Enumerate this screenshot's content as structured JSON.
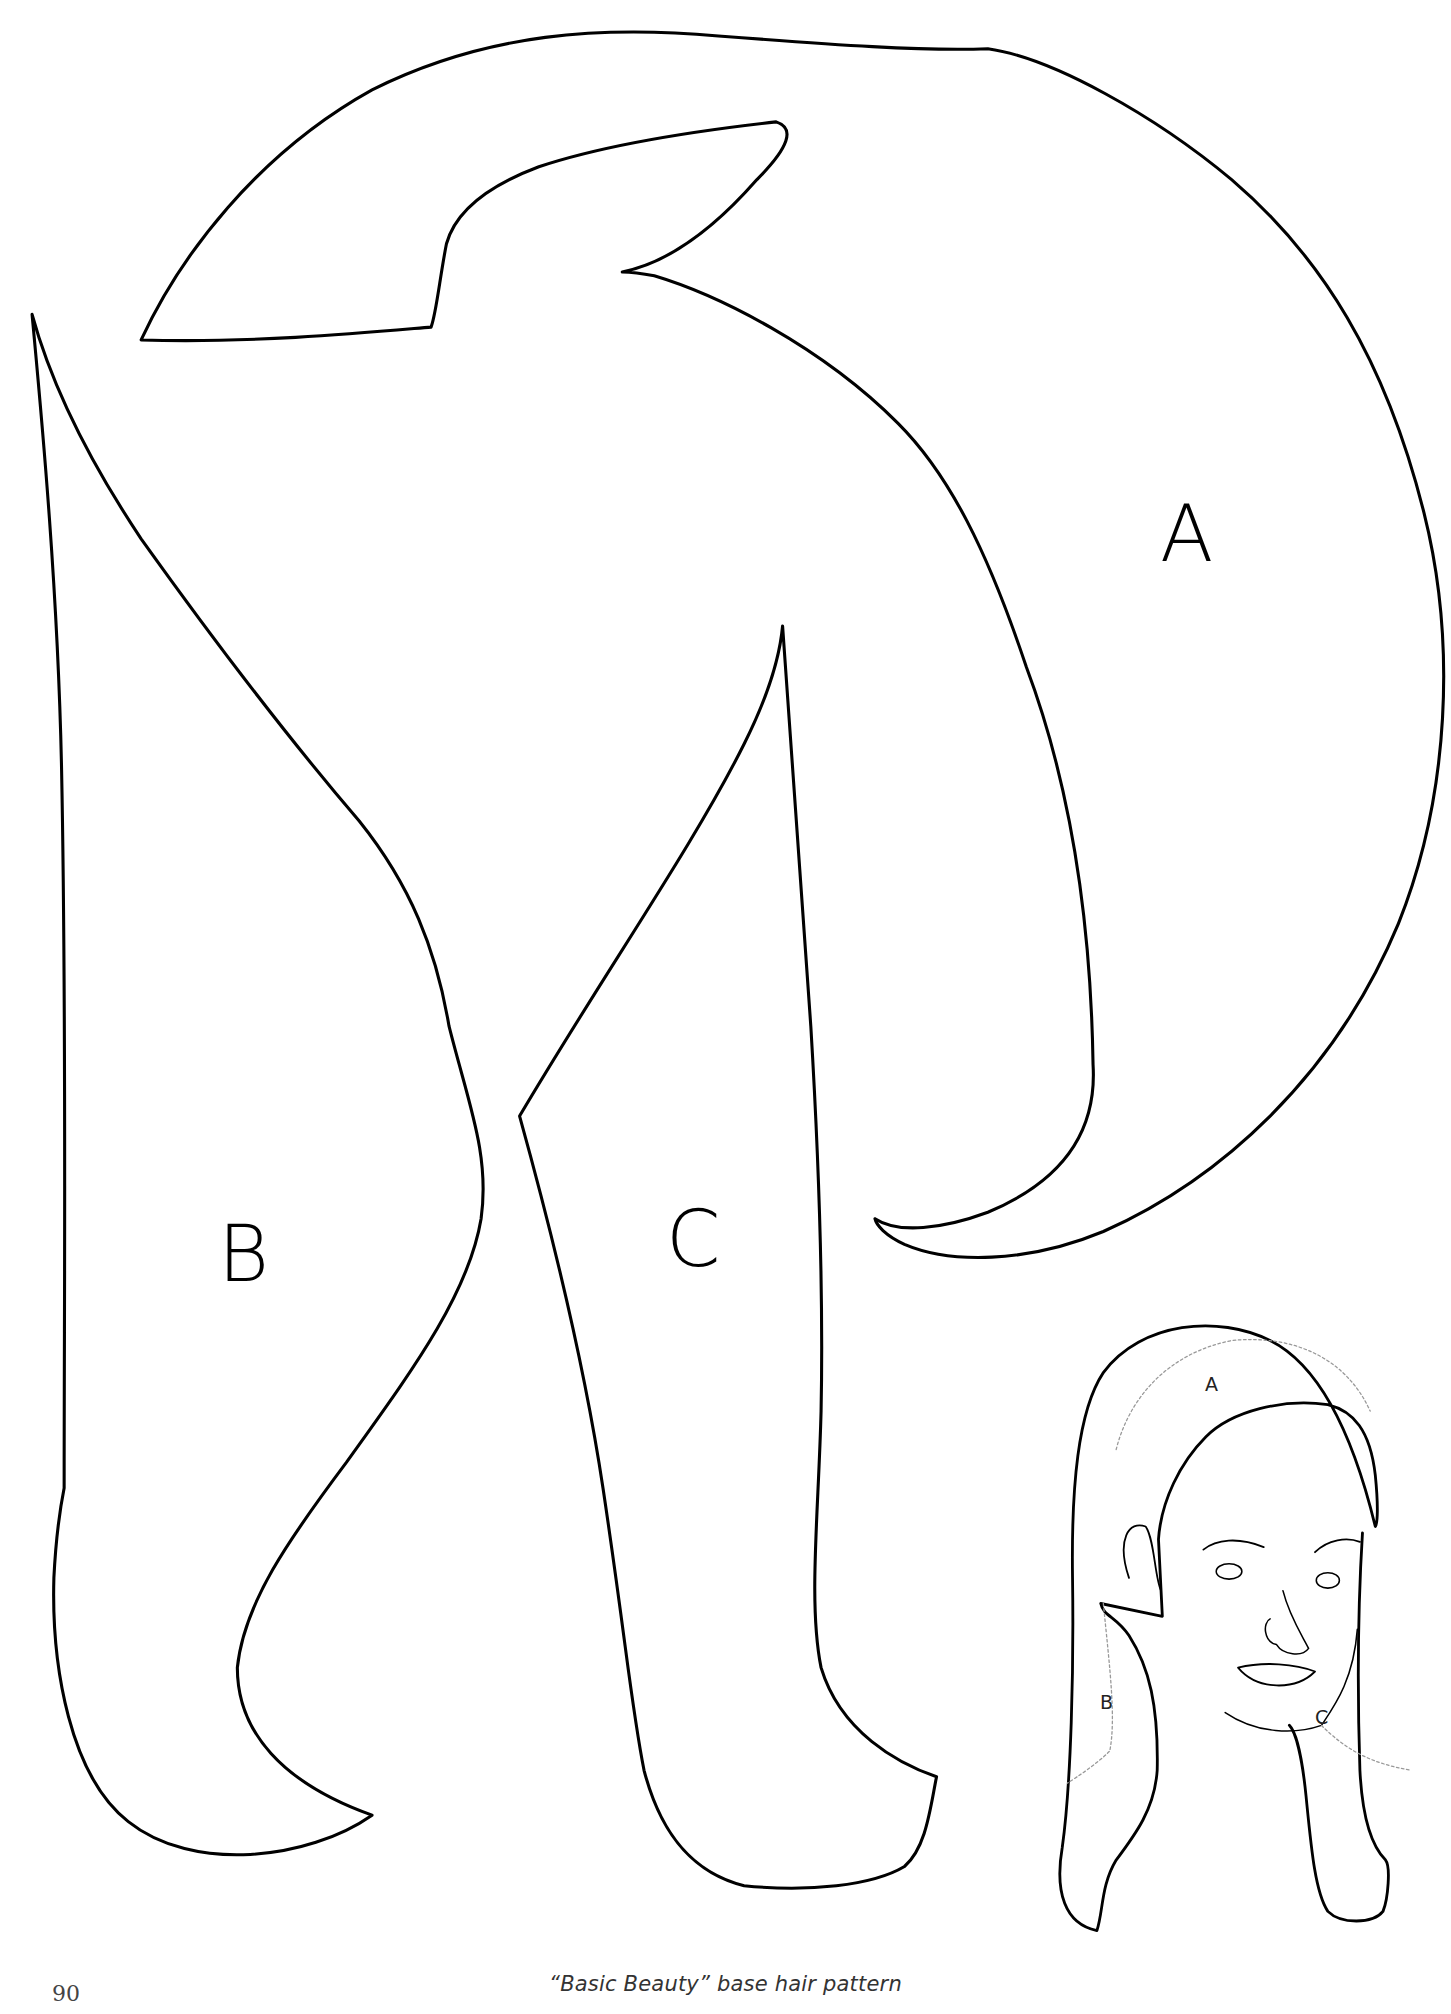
{
  "page": {
    "number": "90",
    "caption": "“Basic Beauty” base hair pattern"
  },
  "pattern": {
    "pieces": [
      {
        "id": "A",
        "label": "A"
      },
      {
        "id": "B",
        "label": "B"
      },
      {
        "id": "C",
        "label": "C"
      }
    ],
    "line_color": "#000000"
  },
  "illustration": {
    "description": "head wearing hair pattern",
    "labels": [
      "A",
      "B",
      "C"
    ]
  }
}
